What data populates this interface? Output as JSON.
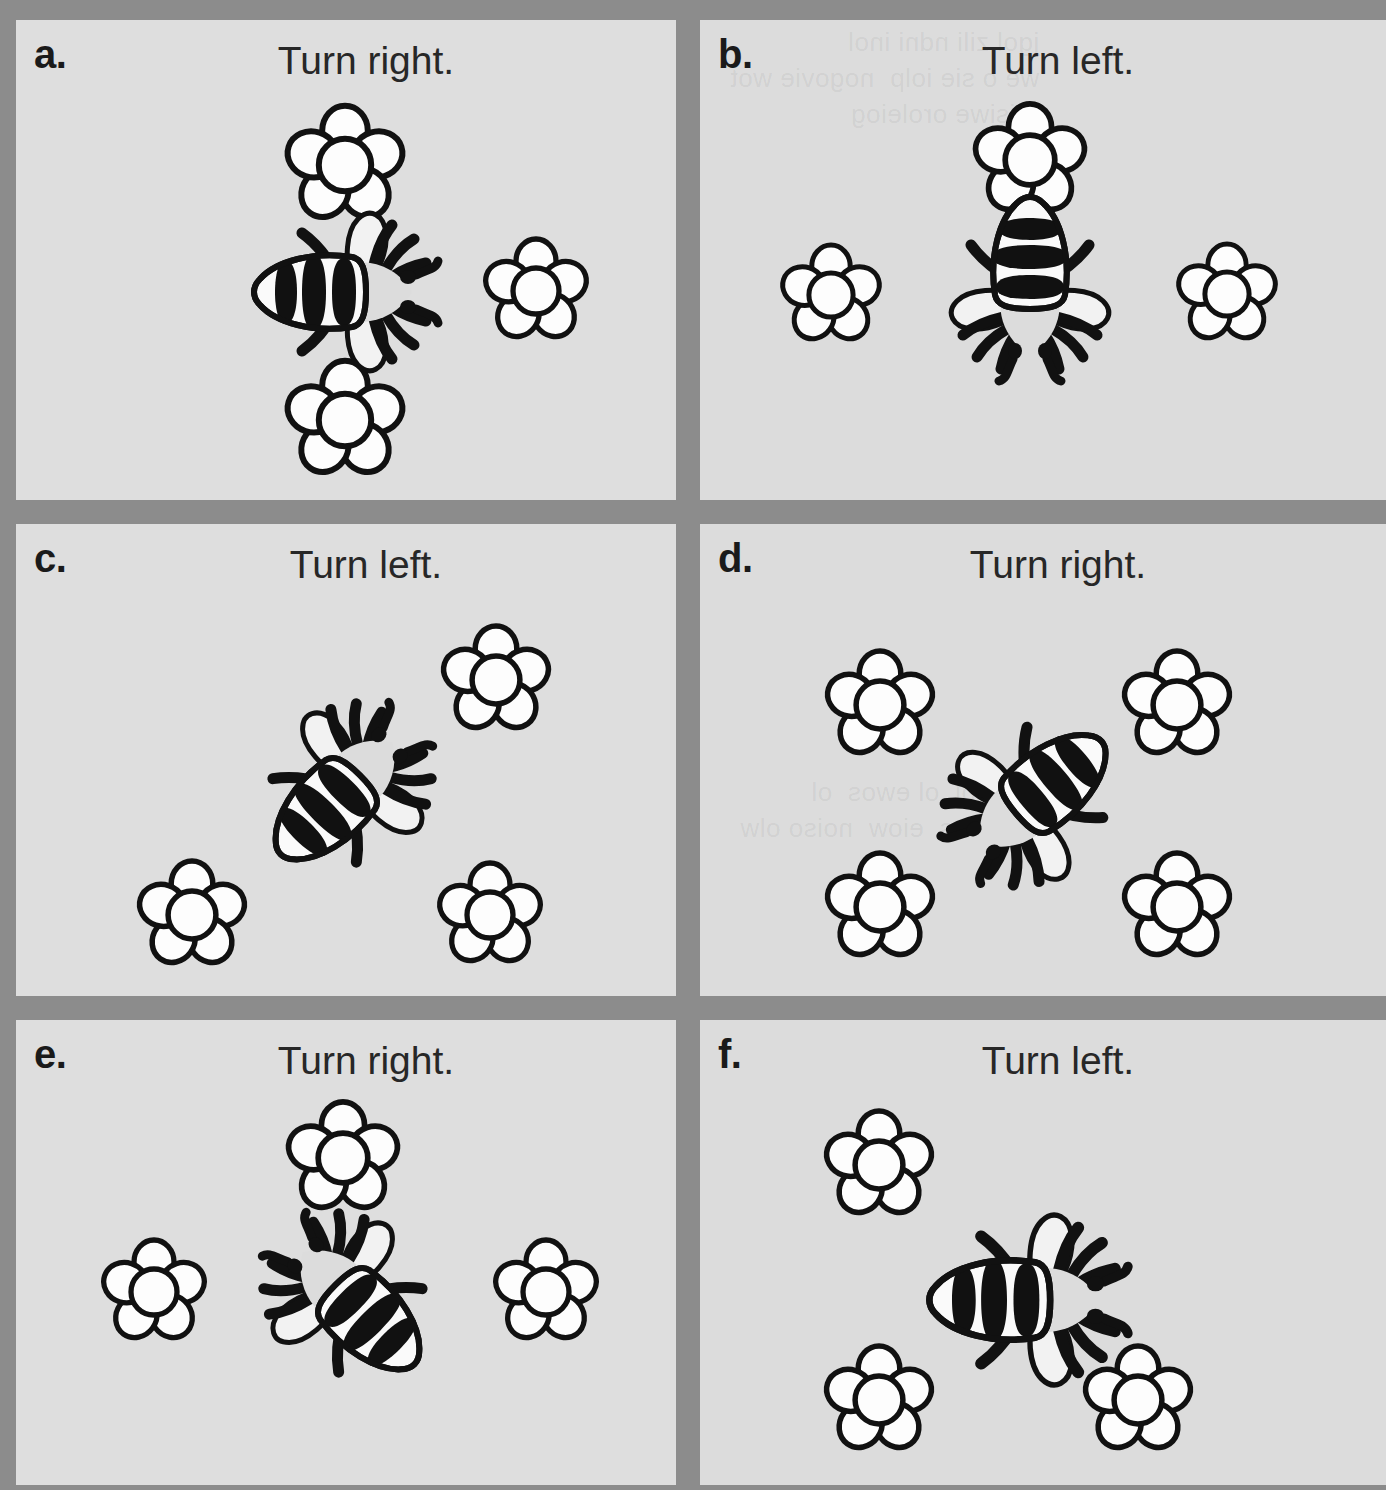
{
  "page": {
    "background_color": "#8c8c8c",
    "panel_color": "#dedede",
    "ink_color": "#111111",
    "columns": 2,
    "rows": 3
  },
  "panels": [
    {
      "id": "a",
      "label": "a.",
      "title": "Turn right.",
      "bee": {
        "x": 345,
        "y": 292,
        "rotation": 0,
        "scale": 1.0
      },
      "flowers": [
        {
          "x": 345,
          "y": 165,
          "r": 57
        },
        {
          "x": 536,
          "y": 291,
          "r": 50
        },
        {
          "x": 345,
          "y": 420,
          "r": 57
        }
      ]
    },
    {
      "id": "b",
      "label": "b.",
      "title": "Turn left.",
      "bee": {
        "x": 1030,
        "y": 288,
        "rotation": 90,
        "scale": 1.0
      },
      "flowers": [
        {
          "x": 1030,
          "y": 160,
          "r": 54
        },
        {
          "x": 831,
          "y": 295,
          "r": 48
        },
        {
          "x": 1227,
          "y": 294,
          "r": 48
        }
      ]
    },
    {
      "id": "c",
      "label": "c.",
      "title": "Turn left.",
      "bee": {
        "x": 345,
        "y": 790,
        "rotation": -45,
        "scale": 1.0
      },
      "flowers": [
        {
          "x": 496,
          "y": 680,
          "r": 52
        },
        {
          "x": 192,
          "y": 915,
          "r": 52
        },
        {
          "x": 490,
          "y": 915,
          "r": 50
        }
      ]
    },
    {
      "id": "d",
      "label": "d.",
      "title": "Turn right.",
      "bee": {
        "x": 1032,
        "y": 800,
        "rotation": 140,
        "scale": 1.0
      },
      "flowers": [
        {
          "x": 880,
          "y": 705,
          "r": 52
        },
        {
          "x": 1177,
          "y": 705,
          "r": 52
        },
        {
          "x": 880,
          "y": 907,
          "r": 52
        },
        {
          "x": 1177,
          "y": 907,
          "r": 52
        }
      ]
    },
    {
      "id": "e",
      "label": "e.",
      "title": "Turn right.",
      "bee": {
        "x": 350,
        "y": 1300,
        "rotation": 225,
        "scale": 1.0
      },
      "flowers": [
        {
          "x": 343,
          "y": 1158,
          "r": 54
        },
        {
          "x": 154,
          "y": 1292,
          "r": 50
        },
        {
          "x": 546,
          "y": 1292,
          "r": 50
        }
      ]
    },
    {
      "id": "f",
      "label": "f.",
      "title": "Turn left.",
      "bee": {
        "x": 1027,
        "y": 1300,
        "rotation": 0,
        "scale": 1.08
      },
      "flowers": [
        {
          "x": 879,
          "y": 1165,
          "r": 52
        },
        {
          "x": 879,
          "y": 1400,
          "r": 52
        },
        {
          "x": 1138,
          "y": 1400,
          "r": 52
        }
      ]
    }
  ],
  "icons": {
    "bee": "bee-icon",
    "flower": "flower-icon"
  },
  "bleed_text": {
    "b_top": "jgol zili ndni inol\nwe o sie iolp  nogovie wot\nreisiwe oroleiog",
    "d_mid": "nowol  ol ewos  ol\nwol ros  eiow  noiso olw",
    "d_top": "gol eiow eroseol oj wol"
  }
}
